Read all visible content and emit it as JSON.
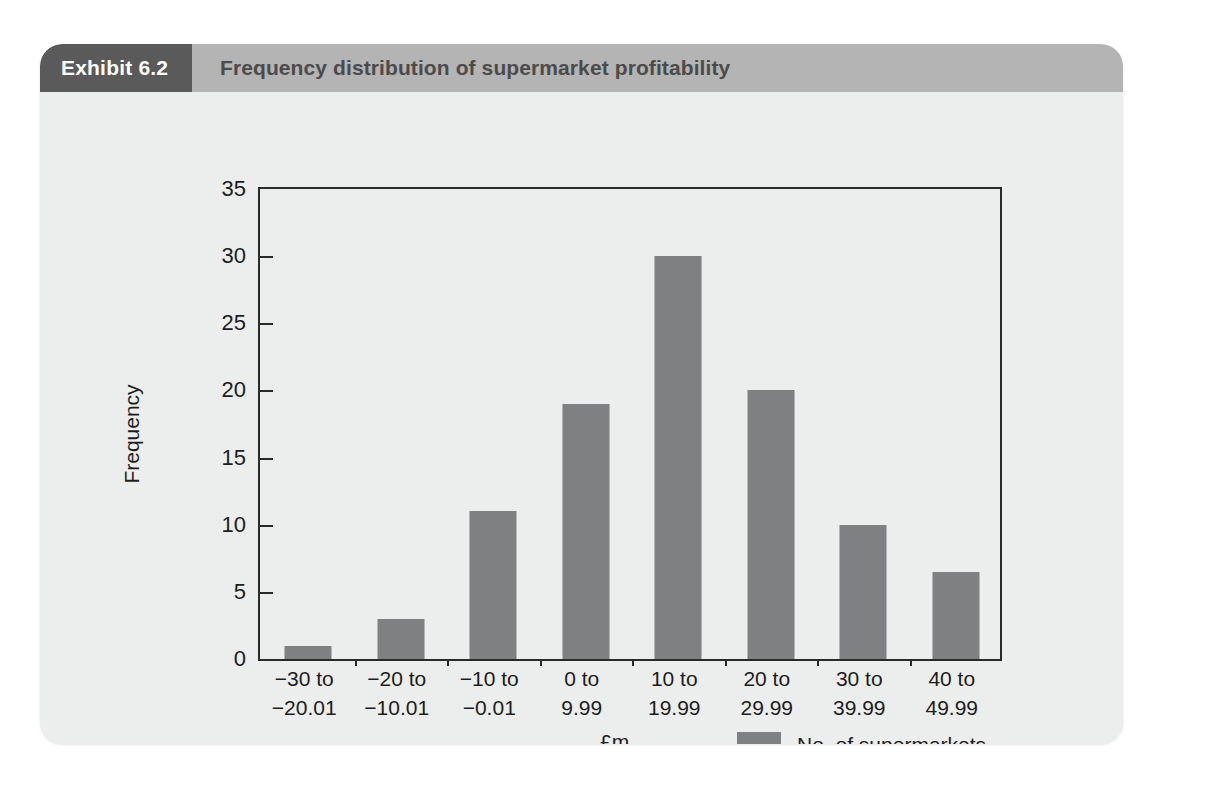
{
  "exhibit": {
    "number_label": "Exhibit 6.2",
    "title": "Frequency distribution of supermarket profitability"
  },
  "colors": {
    "card_background": "#eceded",
    "header_dark": "#5a5a5a",
    "header_light": "#b4b4b4",
    "bar_fill": "#7e8082",
    "axis": "#2a2a2a",
    "text": "#1d1d1d"
  },
  "chart_data": {
    "type": "bar",
    "title": "Frequency distribution of supermarket profitability",
    "subtitle": "",
    "xlabel": "£m",
    "ylabel": "Frequency",
    "categories": [
      "−30 to\n−20.01",
      "−20 to\n−10.01",
      "−10 to\n−0.01",
      "0 to\n9.99",
      "10 to\n19.99",
      "20 to\n29.99",
      "30 to\n39.99",
      "40 to\n49.99"
    ],
    "category_lines": [
      [
        "−30 to",
        "−20.01"
      ],
      [
        "−20 to",
        "−10.01"
      ],
      [
        "−10 to",
        "−0.01"
      ],
      [
        "0 to",
        "9.99"
      ],
      [
        "10 to",
        "19.99"
      ],
      [
        "20 to",
        "29.99"
      ],
      [
        "30 to",
        "39.99"
      ],
      [
        "40 to",
        "49.99"
      ]
    ],
    "series": [
      {
        "name": "No. of supermarkets",
        "values": [
          1,
          3,
          11,
          19,
          30,
          20,
          10,
          6.5
        ]
      }
    ],
    "values": [
      1,
      3,
      11,
      19,
      30,
      20,
      10,
      6.5
    ],
    "ylim": [
      0,
      35
    ],
    "yticks": [
      0,
      5,
      10,
      15,
      20,
      25,
      30,
      35
    ],
    "ytick_labels": [
      "0",
      "5",
      "10",
      "15",
      "20",
      "25",
      "30",
      "35"
    ],
    "grid": false,
    "legend": {
      "position": "bottom-right",
      "entries": [
        "No. of supermarkets"
      ]
    }
  }
}
